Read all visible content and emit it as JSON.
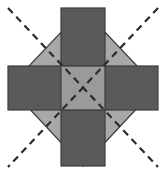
{
  "figure": {
    "title": "",
    "canvas": {
      "width": 166,
      "height": 175,
      "background": "#ffffff"
    },
    "colors": {
      "diamond_fill": "#a8a8a8",
      "cross_fill": "#5a5a5a",
      "center_fill": "#9a9a9a",
      "outline": "#3c3c3c",
      "dash_line": "#2b2b2b",
      "background": "#ffffff"
    },
    "shapes": {
      "diamond": {
        "name": "rotated-square",
        "vertices": [
          [
            83,
            9
          ],
          [
            157,
            87
          ],
          [
            83,
            166
          ],
          [
            9,
            87
          ]
        ],
        "fill": "#a8a8a8"
      },
      "cross": {
        "name": "greek-cross",
        "vertical_arm": {
          "x": 61,
          "y": 8,
          "width": 44,
          "height": 158
        },
        "horizontal_arm": {
          "x": 8,
          "y": 66,
          "width": 150,
          "height": 44
        },
        "fill": "#5a5a5a"
      },
      "center_square": {
        "name": "center-intersection-square",
        "x": 61,
        "y": 66,
        "width": 44,
        "height": 44,
        "fill": "#9a9a9a"
      }
    },
    "dashed_lines": [
      {
        "name": "diagonal-nw-se",
        "x1": 8,
        "y1": 8,
        "x2": 158,
        "y2": 167
      },
      {
        "name": "diagonal-ne-sw",
        "x1": 158,
        "y1": 8,
        "x2": 8,
        "y2": 167
      }
    ],
    "dash_pattern": "7 5",
    "dash_width": 2.2,
    "stroke_width": 1.2
  }
}
